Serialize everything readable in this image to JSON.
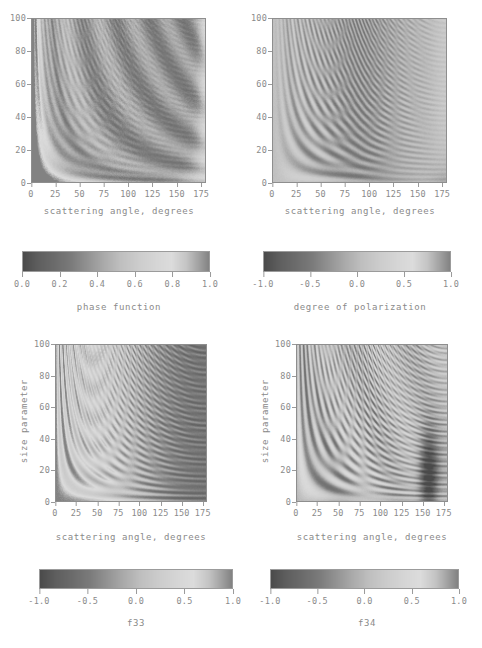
{
  "figure": {
    "title_partial": "",
    "colormap": "grayscale-rainbow",
    "background": "#ffffff",
    "text_color": "#8a8a8a",
    "frame_color": "#8e8e8e"
  },
  "chart_data": [
    {
      "type": "heatmap",
      "id": "phase-function",
      "title": "",
      "xlabel": "scattering angle, degrees",
      "ylabel": "",
      "xlim": [
        0,
        180
      ],
      "ylim": [
        0,
        100
      ],
      "xticks": [
        "0",
        "25",
        "50",
        "75",
        "100",
        "125",
        "150",
        "175"
      ],
      "xtick_values": [
        0,
        25,
        50,
        75,
        100,
        125,
        150,
        175
      ],
      "yticks": [
        "0",
        "20",
        "40",
        "60",
        "80",
        "100"
      ],
      "ytick_values": [
        0,
        20,
        40,
        60,
        80,
        100
      ],
      "grid": false,
      "colorbar": {
        "label": "phase function",
        "vmin": 0.0,
        "vmax": 1.0,
        "ticks": [
          "0.0",
          "0.2",
          "0.4",
          "0.6",
          "0.8",
          "1.0"
        ],
        "tick_values": [
          0.0,
          0.2,
          0.4,
          0.6,
          0.8,
          1.0
        ]
      }
    },
    {
      "type": "heatmap",
      "id": "degree-of-polarization",
      "title": "",
      "xlabel": "scattering angle, degrees",
      "ylabel": "",
      "xlim": [
        0,
        180
      ],
      "ylim": [
        0,
        100
      ],
      "xticks": [
        "0",
        "25",
        "50",
        "75",
        "100",
        "125",
        "150",
        "175"
      ],
      "xtick_values": [
        0,
        25,
        50,
        75,
        100,
        125,
        150,
        175
      ],
      "yticks": [
        "0",
        "20",
        "40",
        "60",
        "80",
        "100"
      ],
      "ytick_values": [
        0,
        20,
        40,
        60,
        80,
        100
      ],
      "grid": false,
      "colorbar": {
        "label": "degree of polarization",
        "vmin": -1.0,
        "vmax": 1.0,
        "ticks": [
          "-1.0",
          "-0.5",
          "0.0",
          "0.5",
          "1.0"
        ],
        "tick_values": [
          -1.0,
          -0.5,
          0.0,
          0.5,
          1.0
        ]
      }
    },
    {
      "type": "heatmap",
      "id": "f33",
      "title": "",
      "xlabel": "scattering angle, degrees",
      "ylabel": "size parameter",
      "xlim": [
        0,
        180
      ],
      "ylim": [
        0,
        100
      ],
      "xticks": [
        "0",
        "25",
        "50",
        "75",
        "100",
        "125",
        "150",
        "175"
      ],
      "xtick_values": [
        0,
        25,
        50,
        75,
        100,
        125,
        150,
        175
      ],
      "yticks": [
        "0",
        "20",
        "40",
        "60",
        "80",
        "100"
      ],
      "ytick_values": [
        0,
        20,
        40,
        60,
        80,
        100
      ],
      "grid": false,
      "colorbar": {
        "label": "f33",
        "vmin": -1.0,
        "vmax": 1.0,
        "ticks": [
          "-1.0",
          "-0.5",
          "0.0",
          "0.5",
          "1.0"
        ],
        "tick_values": [
          -1.0,
          -0.5,
          0.0,
          0.5,
          1.0
        ]
      }
    },
    {
      "type": "heatmap",
      "id": "f34",
      "title": "",
      "xlabel": "scattering angle, degrees",
      "ylabel": "size parameter",
      "xlim": [
        0,
        180
      ],
      "ylim": [
        0,
        100
      ],
      "xticks": [
        "0",
        "25",
        "50",
        "75",
        "100",
        "125",
        "150",
        "175"
      ],
      "xtick_values": [
        0,
        25,
        50,
        75,
        100,
        125,
        150,
        175
      ],
      "yticks": [
        "0",
        "20",
        "40",
        "60",
        "80",
        "100"
      ],
      "ytick_values": [
        0,
        20,
        40,
        60,
        80,
        100
      ],
      "grid": false,
      "colorbar": {
        "label": "f34",
        "vmin": -1.0,
        "vmax": 1.0,
        "ticks": [
          "-1.0",
          "-0.5",
          "0.0",
          "0.5",
          "1.0"
        ],
        "tick_values": [
          -1.0,
          -0.5,
          0.0,
          0.5,
          1.0
        ]
      }
    }
  ]
}
